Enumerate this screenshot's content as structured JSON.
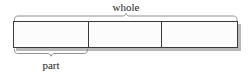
{
  "diagram": {
    "kind": "part-whole-bar-model",
    "background_color": "#ffffff",
    "labels": {
      "whole": "whole",
      "part": "part"
    },
    "bar": {
      "fill_color": "#fcfcfc",
      "border_color": "#3a3a3a",
      "shadow_color": "#b8b8b8",
      "left": 13,
      "right": 238,
      "top": 21,
      "bottom": 48,
      "segment_count": 3,
      "divider_positions": [
        88,
        161
      ]
    },
    "braces": {
      "color": "#8e8e8e",
      "whole": {
        "label": "whole",
        "position": "above",
        "from": 13,
        "to": 238,
        "peak_x": 126,
        "y": 20
      },
      "part": {
        "label": "part",
        "position": "below",
        "from": 13,
        "to": 88,
        "peak_x": 51,
        "y": 49
      }
    }
  }
}
